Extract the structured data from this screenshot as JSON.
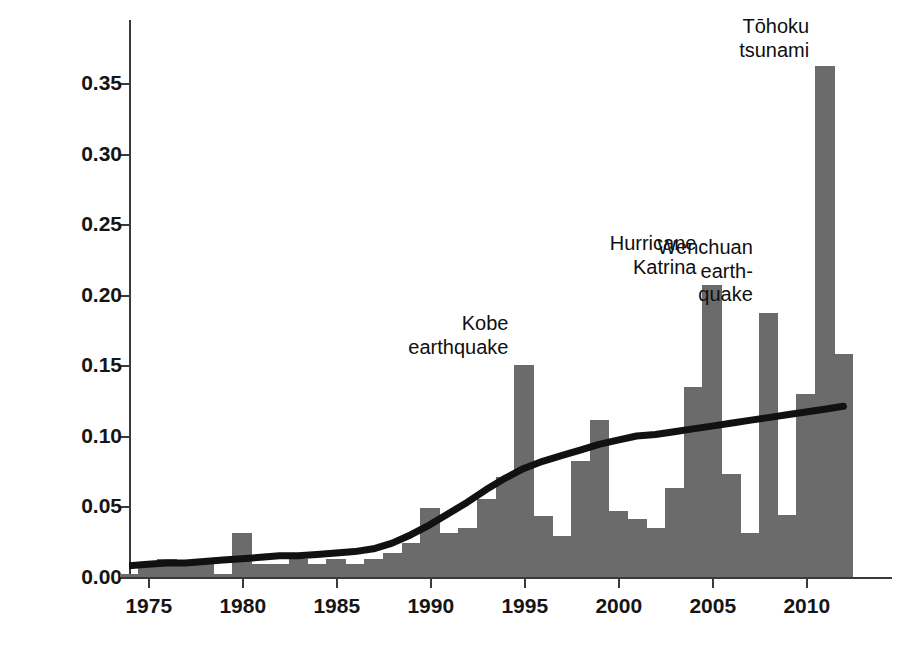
{
  "chart_data": {
    "type": "bar",
    "title": "",
    "xlabel": "",
    "ylabel": "Estimated Damage (US$ billion)",
    "xlim": [
      1974.0,
      1974.0
    ],
    "ylim": [
      0.0,
      0.3949
    ],
    "xticks": [
      1975,
      1980,
      1985,
      1990,
      1995,
      2000,
      2005,
      2010
    ],
    "xtick_labels": [
      "1975",
      "1980",
      "1985",
      "1990",
      "1995",
      "2000",
      "2005",
      "2010"
    ],
    "yticks": [
      0.0,
      0.05,
      0.1,
      0.15,
      0.2,
      0.25,
      0.3,
      0.35
    ],
    "ytick_labels": [
      "0.00",
      "0.05",
      "0.10",
      "0.15",
      "0.20",
      "0.25",
      "0.30",
      "0.35"
    ],
    "grid": false,
    "legend": false,
    "bar_color": "#6b6b6b",
    "trend_color": "#111111",
    "x": [
      1974,
      1975,
      1976,
      1977,
      1978,
      1979,
      1980,
      1981,
      1982,
      1983,
      1984,
      1985,
      1986,
      1987,
      1988,
      1989,
      1990,
      1991,
      1992,
      1993,
      1994,
      1995,
      1996,
      1997,
      1998,
      1999,
      2000,
      2001,
      2002,
      2003,
      2004,
      2005,
      2006,
      2007,
      2008,
      2009,
      2010,
      2011,
      2012
    ],
    "values": [
      0.002,
      0.009,
      0.013,
      0.009,
      0.009,
      0.002,
      0.031,
      0.009,
      0.009,
      0.013,
      0.009,
      0.013,
      0.009,
      0.013,
      0.017,
      0.024,
      0.049,
      0.031,
      0.035,
      0.055,
      0.071,
      0.15,
      0.043,
      0.029,
      0.082,
      0.111,
      0.047,
      0.041,
      0.035,
      0.063,
      0.135,
      0.207,
      0.073,
      0.031,
      0.187,
      0.044,
      0.13,
      0.362,
      0.158
    ],
    "trend": {
      "name": "smoothed trend",
      "x": [
        1974,
        1975,
        1976,
        1977,
        1978,
        1979,
        1980,
        1981,
        1982,
        1983,
        1984,
        1985,
        1986,
        1987,
        1988,
        1989,
        1990,
        1991,
        1992,
        1993,
        1994,
        1995,
        1996,
        1997,
        1998,
        1999,
        2000,
        2001,
        2002,
        2003,
        2004,
        2005,
        2006,
        2007,
        2008,
        2009,
        2010,
        2011,
        2012
      ],
      "values": [
        0.008,
        0.009,
        0.01,
        0.01,
        0.011,
        0.012,
        0.013,
        0.014,
        0.015,
        0.015,
        0.016,
        0.017,
        0.018,
        0.02,
        0.024,
        0.03,
        0.037,
        0.045,
        0.053,
        0.062,
        0.07,
        0.077,
        0.082,
        0.086,
        0.09,
        0.094,
        0.097,
        0.1,
        0.101,
        0.103,
        0.105,
        0.107,
        0.109,
        0.111,
        0.113,
        0.115,
        0.117,
        0.119,
        0.121
      ]
    },
    "annotations": [
      {
        "id": "kobe",
        "text": "Kobe\nearthquake",
        "year": 1995,
        "value": 0.15,
        "align": "right"
      },
      {
        "id": "katrina",
        "text": "Hurricane\nKatrina",
        "year": 2005,
        "value": 0.207,
        "align": "right"
      },
      {
        "id": "wenchuan",
        "text": "Wenchuan\nearth-\nquake",
        "year": 2008,
        "value": 0.187,
        "align": "right"
      },
      {
        "id": "tohoku",
        "text": "Tōhoku\ntsunami",
        "year": 2011,
        "value": 0.362,
        "align": "right"
      }
    ]
  },
  "axis": {
    "ylabel": "Estimated Damage (US$ billion)"
  },
  "annotations": {
    "kobe": {
      "line1": "Kobe",
      "line2": "earthquake"
    },
    "katrina": {
      "line1": "Hurricane",
      "line2": "Katrina"
    },
    "wenchuan": {
      "line1": "Wenchuan",
      "line2": "earth-",
      "line3": "quake"
    },
    "tohoku": {
      "line1": "Tōhoku",
      "line2": "tsunami"
    }
  }
}
